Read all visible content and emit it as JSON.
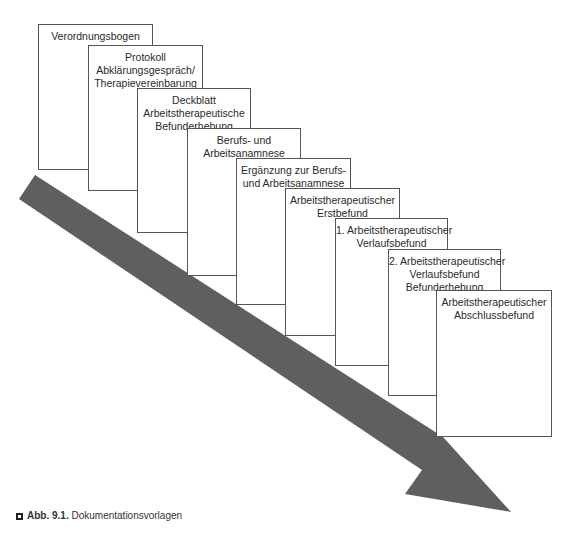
{
  "figure": {
    "arrow_color": "#5f5f5f",
    "box_border_color": "#555555",
    "documents": [
      {
        "lines": [
          "Verordnungsbogen"
        ],
        "x": 38,
        "y": 24,
        "w": 115,
        "h": 146
      },
      {
        "lines": [
          "Protokoll",
          "Abklärungsgespräch/",
          "Therapievereinbarung"
        ],
        "x": 88,
        "y": 45,
        "w": 115,
        "h": 146
      },
      {
        "lines": [
          "Deckblatt",
          "Arbeitstherapeutische",
          "Befunderhebung"
        ],
        "x": 137,
        "y": 88,
        "w": 114,
        "h": 145
      },
      {
        "lines": [
          "Berufs- und",
          "Arbeitsanamnese"
        ],
        "x": 187,
        "y": 128,
        "w": 114,
        "h": 148
      },
      {
        "lines": [
          "Ergänzung zur Berufs-",
          "und Arbeitsanamnese"
        ],
        "x": 236,
        "y": 158,
        "w": 115,
        "h": 147
      },
      {
        "lines": [
          "Arbeitstherapeutischer",
          "Erstbefund"
        ],
        "x": 285,
        "y": 188,
        "w": 115,
        "h": 148
      },
      {
        "lines": [
          "1. Arbeitstherapeutischer",
          "Verlaufsbefund"
        ],
        "x": 335,
        "y": 218,
        "w": 113,
        "h": 148
      },
      {
        "lines": [
          "2. Arbeitstherapeutischer",
          "Verlaufsbefund",
          "Befunderhebung"
        ],
        "x": 388,
        "y": 249,
        "w": 113,
        "h": 147
      },
      {
        "lines": [
          "Arbeitstherapeutischer",
          "Abschlussbefund"
        ],
        "x": 436,
        "y": 290,
        "w": 116,
        "h": 147
      }
    ]
  },
  "caption": {
    "label": "Abb. 9.1.",
    "text": " Dokumentationsvorlagen"
  }
}
